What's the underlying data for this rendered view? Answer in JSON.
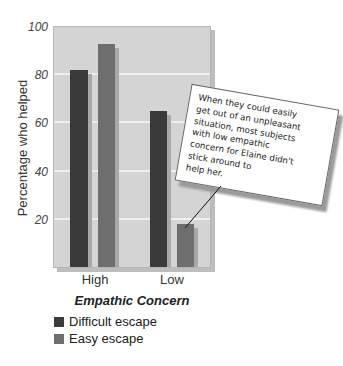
{
  "chart_data": {
    "type": "bar",
    "title": "",
    "xlabel": "Empathic Concern",
    "ylabel": "Percentage who helped",
    "categories": [
      "High",
      "Low"
    ],
    "series": [
      {
        "name": "Difficult escape",
        "color": "#3a3a3a",
        "values": [
          82,
          65
        ]
      },
      {
        "name": "Easy escape",
        "color": "#6e6e6e",
        "values": [
          93,
          18
        ]
      }
    ],
    "ylim": [
      0,
      100
    ],
    "yticks": [
      20,
      40,
      60,
      80,
      100
    ],
    "grid": true,
    "legend_position": "bottom-left",
    "annotation": {
      "text": "When they could easily get out of an unpleasant situation, most subjects with low empathic concern for Elaine didn't stick around to help her.",
      "lines": [
        "When they could easily",
        "get out of an unpleasant",
        "situation, most subjects",
        "with low empathic",
        "concern for Elaine didn't",
        "stick around to",
        "help her."
      ],
      "points_to": {
        "category": "Low",
        "series": "Easy escape"
      }
    }
  },
  "axis": {
    "ylabel": "Percentage who helped",
    "yticks": [
      "20",
      "40",
      "60",
      "80",
      "100"
    ],
    "xticks": [
      "High",
      "Low"
    ],
    "xlabel": "Empathic Concern"
  },
  "legend": {
    "items": [
      {
        "label": "Difficult escape",
        "color": "#3a3a3a"
      },
      {
        "label": "Easy escape",
        "color": "#6e6e6e"
      }
    ]
  },
  "note": {
    "lines": [
      "When they could easily",
      "get out of an unpleasant",
      "situation, most subjects",
      "with low empathic",
      "concern for Elaine didn't",
      "stick around to",
      "help her."
    ]
  }
}
